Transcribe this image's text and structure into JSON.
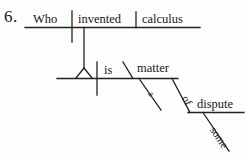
{
  "exercise": {
    "number": "6.",
    "type": "reed-kellogg-sentence-diagram"
  },
  "sentence": {
    "text": "Who invented calculus is a matter of some dispute."
  },
  "main_clause": {
    "subject": "Who",
    "verb": "invented",
    "object": "calculus"
  },
  "predicate_clause": {
    "subject_placeholder": "",
    "verb": "is",
    "complement": "matter",
    "modifiers": [
      {
        "word": "a",
        "attaches_to": "matter"
      },
      {
        "word": "of",
        "attaches_to": "matter"
      }
    ]
  },
  "prepositional_object": {
    "noun": "dispute",
    "modifiers": [
      {
        "word": "some",
        "attaches_to": "dispute"
      }
    ]
  },
  "words": {
    "who": "Who",
    "invented": "invented",
    "calculus": "calculus",
    "is": "is",
    "matter": "matter",
    "a": "a",
    "of": "of",
    "dispute": "dispute",
    "some": "some"
  },
  "style": {
    "ink_color": "#232323",
    "paper_color": "#fdfdfc",
    "line_width": 1.3
  }
}
